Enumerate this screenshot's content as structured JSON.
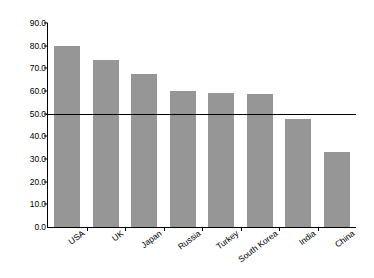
{
  "chart_data": {
    "type": "bar",
    "title": "",
    "subtitle": "",
    "xlabel": "",
    "ylabel": "",
    "categories": [
      "USA",
      "UK",
      "Japan",
      "Russia",
      "Turkey",
      "South Korea",
      "India",
      "China"
    ],
    "values": [
      80.0,
      73.5,
      67.5,
      60.0,
      59.0,
      58.5,
      47.5,
      33.0
    ],
    "ylim": [
      0.0,
      90.0
    ],
    "ytick_step": 10.0,
    "ytick_labels": [
      "90.0",
      "80.0",
      "70.0",
      "60.0",
      "50.0",
      "40.0",
      "30.0",
      "20.0",
      "10.0",
      "0.0"
    ],
    "ytick_values": [
      90.0,
      80.0,
      70.0,
      60.0,
      50.0,
      40.0,
      30.0,
      20.0,
      10.0,
      0.0
    ],
    "grid": false,
    "legend": false,
    "legend_position": "none",
    "bar_color": "#969696",
    "axis_color": "#000000",
    "reference_line": {
      "value": 50.0,
      "color": "#000000",
      "label": ""
    },
    "xlabel_rotation": -37,
    "annotations": []
  }
}
